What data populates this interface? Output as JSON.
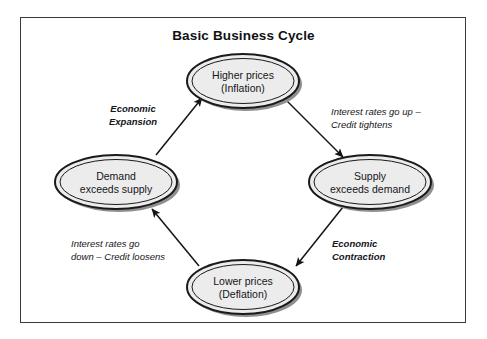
{
  "diagram": {
    "title": "Basic Business Cycle",
    "nodes": [
      {
        "id": "higher-prices",
        "line1": "Higher prices",
        "line2": "(Inflation)",
        "cx": 243,
        "cy": 81
      },
      {
        "id": "supply-exceeds-demand",
        "line1": "Supply",
        "line2": "exceeds demand",
        "cx": 370,
        "cy": 182
      },
      {
        "id": "lower-prices",
        "line1": "Lower prices",
        "line2": "(Deflation)",
        "cx": 243,
        "cy": 287
      },
      {
        "id": "demand-exceeds-supply",
        "line1": "Demand",
        "line2": "exceeds supply",
        "cx": 116,
        "cy": 182
      }
    ],
    "edges": [
      {
        "id": "expansion",
        "from": "demand-exceeds-supply",
        "to": "higher-prices",
        "line1": "Economic",
        "line2": "Expansion",
        "bold": true,
        "lx": 133,
        "ly": 115
      },
      {
        "id": "tightening",
        "from": "higher-prices",
        "to": "supply-exceeds-demand",
        "line1": "Interest rates go up –",
        "line2": "Credit tightens",
        "bold": false,
        "lx": 331,
        "ly": 118
      },
      {
        "id": "contraction",
        "from": "supply-exceeds-demand",
        "to": "lower-prices",
        "line1": "Economic",
        "line2": "Contraction",
        "bold": true,
        "lx": 332,
        "ly": 250
      },
      {
        "id": "loosening",
        "from": "lower-prices",
        "to": "demand-exceeds-supply",
        "line1": "Interest rates go",
        "line2": "down – Credit loosens",
        "bold": false,
        "lx": 71,
        "ly": 250
      }
    ],
    "colors": {
      "frame_border": "#3a3a3e",
      "node_fill": "#ececec",
      "node_outline": "#1a1a1e",
      "node_shadow": "#8a8a8a",
      "arrow": "#141418",
      "text": "#15151a",
      "background": "#ffffff"
    }
  }
}
